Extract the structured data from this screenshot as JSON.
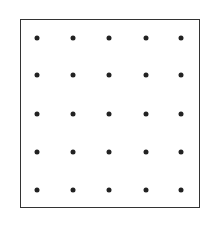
{
  "diagram": {
    "type": "dot-grid",
    "rows": 5,
    "cols": 5,
    "frame_color": "#333333",
    "dot_color": "#222222",
    "col_x": [
      37,
      73,
      109,
      146,
      181
    ],
    "row_y": [
      38,
      75,
      114,
      152,
      190
    ]
  }
}
